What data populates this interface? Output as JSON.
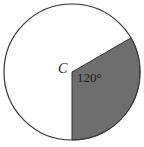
{
  "diagram": {
    "center_label": "C",
    "angle_label": "120°",
    "angle_degrees": 120,
    "sector_color": "#6e6e6e",
    "outline_color": "#333333"
  }
}
